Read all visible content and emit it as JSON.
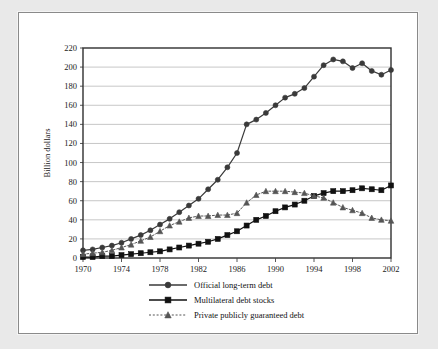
{
  "figure": {
    "background_color": "#e9e9e9",
    "panel_color": "#ffffff",
    "border_color": "#8a8a8a"
  },
  "chart_data": {
    "type": "line",
    "title": "",
    "xlabel": "",
    "ylabel": "Billion dollars",
    "xlim": [
      1970,
      2002
    ],
    "ylim": [
      0,
      220
    ],
    "ytick_step": 20,
    "xtick_step": 4,
    "grid": true,
    "legend_position": "bottom",
    "xticks": [
      "1970",
      "1974",
      "1978",
      "1982",
      "1986",
      "1990",
      "1994",
      "1998",
      "2002"
    ],
    "yticks": [
      "0",
      "20",
      "40",
      "60",
      "80",
      "100",
      "120",
      "140",
      "160",
      "180",
      "200",
      "220"
    ],
    "x": [
      1970,
      1971,
      1972,
      1973,
      1974,
      1975,
      1976,
      1977,
      1978,
      1979,
      1980,
      1981,
      1982,
      1983,
      1984,
      1985,
      1986,
      1987,
      1988,
      1989,
      1990,
      1991,
      1992,
      1993,
      1994,
      1995,
      1996,
      1997,
      1998,
      1999,
      2000,
      2001,
      2002
    ],
    "series": [
      {
        "name": "Official long-term debt",
        "marker": "circle",
        "line_style": "solid",
        "color": "#3a3a3a",
        "values": [
          8,
          9,
          11,
          13,
          16,
          20,
          24,
          29,
          35,
          41,
          48,
          55,
          62,
          72,
          82,
          95,
          110,
          140,
          145,
          152,
          160,
          168,
          172,
          178,
          190,
          202,
          208,
          206,
          199,
          204,
          196,
          192,
          197
        ]
      },
      {
        "name": "Multilateral debt stocks",
        "marker": "square",
        "line_style": "solid",
        "color": "#111111",
        "values": [
          1,
          1,
          2,
          2,
          3,
          4,
          5,
          6,
          7,
          9,
          11,
          13,
          15,
          17,
          20,
          24,
          28,
          34,
          40,
          44,
          49,
          53,
          56,
          60,
          65,
          68,
          70,
          70,
          71,
          73,
          72,
          71,
          76
        ]
      },
      {
        "name": "Private publicly guaranteed debt",
        "marker": "triangle",
        "line_style": "dashed",
        "color": "#555555",
        "values": [
          4,
          5,
          6,
          8,
          11,
          14,
          18,
          22,
          28,
          34,
          38,
          42,
          44,
          44,
          45,
          45,
          47,
          58,
          66,
          70,
          70,
          70,
          69,
          68,
          65,
          63,
          58,
          53,
          50,
          47,
          42,
          40,
          39
        ]
      }
    ]
  },
  "legend": {
    "items": [
      {
        "label": "Official long-term debt",
        "marker": "circle",
        "line_style": "solid"
      },
      {
        "label": "Multilateral debt stocks",
        "marker": "square",
        "line_style": "solid"
      },
      {
        "label": "Private publicly guaranteed debt",
        "marker": "triangle",
        "line_style": "dashed"
      }
    ]
  }
}
